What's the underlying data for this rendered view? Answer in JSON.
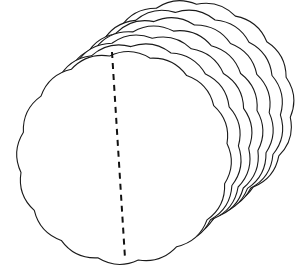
{
  "figure": {
    "colors": {
      "background": "#ffffff",
      "stroke": "#1a1a1a",
      "fill": "#ffffff",
      "dash": "#111111"
    },
    "disc": {
      "count": 7,
      "front_center": [
        124,
        158
      ],
      "rx": 104,
      "ry": 103,
      "scallops": 16,
      "scallop_depth": 5,
      "layer_offset": [
        10.5,
        -8.5
      ],
      "rotation_deg": -8
    },
    "dashed_line": {
      "x1": 112,
      "y1": 52,
      "x2": 125,
      "y2": 258
    }
  }
}
